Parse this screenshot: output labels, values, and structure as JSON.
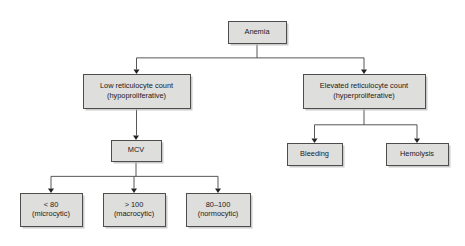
{
  "diagram": {
    "type": "flowchart",
    "background_color": "#ffffff",
    "node_fill_color": "#dededd",
    "node_border_color": "#4d4d4d",
    "connector_color": "#444444",
    "text_color": "#1a1a1a",
    "nodes": [
      {
        "id": "anemia",
        "lines": [
          "Anemia"
        ],
        "x": 228,
        "y": 21,
        "w": 58,
        "h": 22
      },
      {
        "id": "low-retic",
        "lines": [
          "Low reticulocyte count",
          "(hypoproliferative)"
        ],
        "x": 83,
        "y": 74,
        "w": 107,
        "h": 34
      },
      {
        "id": "elevated-retic",
        "lines": [
          "Elevated reticulocyte count",
          "(hyperproliferative)"
        ],
        "x": 303,
        "y": 74,
        "w": 122,
        "h": 34
      },
      {
        "id": "mcv",
        "lines": [
          "MCV"
        ],
        "x": 111,
        "y": 140,
        "w": 50,
        "h": 21
      },
      {
        "id": "bleeding",
        "lines": [
          "Bleeding"
        ],
        "x": 287,
        "y": 143,
        "w": 55,
        "h": 22
      },
      {
        "id": "hemolysis",
        "lines": [
          "Hemolysis"
        ],
        "x": 386,
        "y": 143,
        "w": 62,
        "h": 22
      },
      {
        "id": "microcytic",
        "lines": [
          "< 80",
          "(microcytic)"
        ],
        "x": 20,
        "y": 193,
        "w": 62,
        "h": 33
      },
      {
        "id": "macrocytic",
        "lines": [
          "> 100",
          "(macrocytic)"
        ],
        "x": 103,
        "y": 193,
        "w": 62,
        "h": 33
      },
      {
        "id": "normocytic",
        "lines": [
          "80–100",
          "(normocytic)"
        ],
        "x": 186,
        "y": 193,
        "w": 64,
        "h": 33
      }
    ],
    "edges": [
      {
        "id": "anemia-to-low-retic",
        "from": "anemia",
        "to": "low-retic"
      },
      {
        "id": "anemia-to-elevated-retic",
        "from": "anemia",
        "to": "elevated-retic"
      },
      {
        "id": "low-retic-to-mcv",
        "from": "low-retic",
        "to": "mcv"
      },
      {
        "id": "elevated-retic-to-bleeding",
        "from": "elevated-retic",
        "to": "bleeding"
      },
      {
        "id": "elevated-retic-to-hemolysis",
        "from": "elevated-retic",
        "to": "hemolysis"
      },
      {
        "id": "mcv-to-microcytic",
        "from": "mcv",
        "to": "microcytic"
      },
      {
        "id": "mcv-to-macrocytic",
        "from": "mcv",
        "to": "macrocytic"
      },
      {
        "id": "mcv-to-normocytic",
        "from": "mcv",
        "to": "normocytic"
      }
    ]
  }
}
